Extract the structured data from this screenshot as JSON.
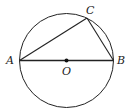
{
  "diagram": {
    "type": "circle-inscribed-triangle",
    "circle": {
      "center_label": "O",
      "cx": 66.5,
      "cy": 60.5,
      "r": 47
    },
    "points": {
      "A": {
        "label": "A",
        "x": 19.5,
        "y": 60.5
      },
      "B": {
        "label": "B",
        "x": 113.5,
        "y": 60.5
      },
      "C": {
        "label": "C",
        "x": 87,
        "y": 18
      },
      "O": {
        "label": "O",
        "x": 66.5,
        "y": 60.5
      }
    },
    "segments": [
      "AB",
      "AC",
      "BC"
    ],
    "colors": {
      "stroke": "#222222",
      "background": "#ffffff"
    }
  }
}
